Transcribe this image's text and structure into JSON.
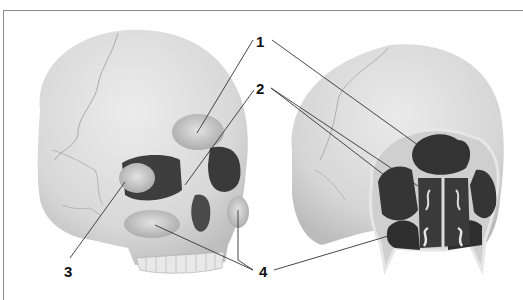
{
  "figure": {
    "labels": [
      {
        "id": "1",
        "text": "1",
        "x": 256,
        "y": 34
      },
      {
        "id": "2",
        "text": "2",
        "x": 256,
        "y": 81
      },
      {
        "id": "3",
        "text": "3",
        "x": 64,
        "y": 264
      },
      {
        "id": "4",
        "text": "4",
        "x": 259,
        "y": 264
      }
    ],
    "views": [
      "left-skull-oblique",
      "right-skull-section"
    ],
    "colors": {
      "bone": "#d6d6d6",
      "bone_light": "#e6e6e6",
      "sinus_dark": "#3c3c3c",
      "sinus_light": "#b9b9b9",
      "leader_line": "#333333",
      "frame": "#8a8a8a"
    }
  }
}
